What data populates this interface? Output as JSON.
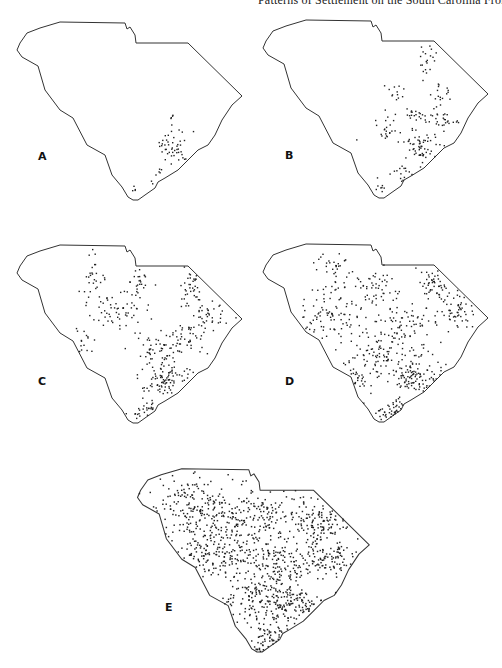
{
  "page": {
    "running_head": "Patterns of Settlement on the South Carolina Frontier"
  },
  "figure": {
    "outline_path": "M17,50 L20,43 L27,33 L40,28 L50,25 L60,22 L125,23 L127,29 L130,27 L135,35 L136,43 L188,43 L242,96 L232,105 L222,120 L215,135 L208,145 L198,150 L188,160 L178,170 L165,178 L158,182 L155,188 L145,195 L138,200 L133,200 L128,197 L122,187 L112,175 L105,155 L87,145 L73,118 L60,110 L45,90 L38,66 L22,57 Z",
    "panels": [
      {
        "label": "A",
        "offset": [
          0,
          0
        ],
        "scale": 1,
        "label_pos": [
          38,
          160
        ],
        "clusters": [
          {
            "cx": 172,
            "cy": 116,
            "rx": 4,
            "ry": 3,
            "n": 4
          },
          {
            "cx": 174,
            "cy": 147,
            "rx": 12,
            "ry": 14,
            "n": 45
          },
          {
            "cx": 194,
            "cy": 132,
            "rx": 1,
            "ry": 1,
            "n": 1
          },
          {
            "cx": 161,
            "cy": 172,
            "rx": 4,
            "ry": 4,
            "n": 5
          },
          {
            "cx": 150,
            "cy": 182,
            "rx": 3,
            "ry": 2,
            "n": 2
          },
          {
            "cx": 134,
            "cy": 189,
            "rx": 3,
            "ry": 3,
            "n": 4
          }
        ]
      },
      {
        "label": "B",
        "offset": [
          246,
          -2
        ],
        "scale": 1,
        "label_pos": [
          285,
          159
        ],
        "clusters": [
          {
            "cx": 180,
            "cy": 60,
            "rx": 8,
            "ry": 15,
            "n": 20
          },
          {
            "cx": 195,
            "cy": 95,
            "rx": 10,
            "ry": 12,
            "n": 18
          },
          {
            "cx": 150,
            "cy": 95,
            "rx": 10,
            "ry": 8,
            "n": 12
          },
          {
            "cx": 160,
            "cy": 118,
            "rx": 22,
            "ry": 7,
            "n": 25
          },
          {
            "cx": 200,
            "cy": 122,
            "rx": 16,
            "ry": 8,
            "n": 25
          },
          {
            "cx": 140,
            "cy": 135,
            "rx": 14,
            "ry": 10,
            "n": 20
          },
          {
            "cx": 175,
            "cy": 150,
            "rx": 14,
            "ry": 14,
            "n": 60
          },
          {
            "cx": 158,
            "cy": 175,
            "rx": 8,
            "ry": 8,
            "n": 15
          },
          {
            "cx": 134,
            "cy": 188,
            "rx": 4,
            "ry": 4,
            "n": 8
          }
        ]
      },
      {
        "label": "C",
        "offset": [
          0,
          223
        ],
        "scale": 1,
        "label_pos": [
          38,
          385
        ],
        "clusters": [
          {
            "cx": 95,
            "cy": 55,
            "rx": 10,
            "ry": 18,
            "n": 25
          },
          {
            "cx": 115,
            "cy": 85,
            "rx": 30,
            "ry": 15,
            "n": 60
          },
          {
            "cx": 140,
            "cy": 60,
            "rx": 8,
            "ry": 20,
            "n": 25
          },
          {
            "cx": 190,
            "cy": 60,
            "rx": 10,
            "ry": 18,
            "n": 35
          },
          {
            "cx": 210,
            "cy": 90,
            "rx": 18,
            "ry": 12,
            "n": 40
          },
          {
            "cx": 190,
            "cy": 115,
            "rx": 15,
            "ry": 12,
            "n": 35
          },
          {
            "cx": 160,
            "cy": 125,
            "rx": 25,
            "ry": 12,
            "n": 60
          },
          {
            "cx": 165,
            "cy": 155,
            "rx": 22,
            "ry": 15,
            "n": 90
          },
          {
            "cx": 85,
            "cy": 120,
            "rx": 10,
            "ry": 15,
            "n": 15
          },
          {
            "cx": 150,
            "cy": 185,
            "rx": 10,
            "ry": 10,
            "n": 20
          },
          {
            "cx": 135,
            "cy": 190,
            "rx": 5,
            "ry": 5,
            "n": 8
          }
        ]
      },
      {
        "label": "D",
        "offset": [
          246,
          222
        ],
        "scale": 1,
        "label_pos": [
          285,
          385
        ],
        "clusters": [
          {
            "cx": 90,
            "cy": 55,
            "rx": 15,
            "ry": 20,
            "n": 45
          },
          {
            "cx": 125,
            "cy": 65,
            "rx": 20,
            "ry": 20,
            "n": 50
          },
          {
            "cx": 80,
            "cy": 95,
            "rx": 30,
            "ry": 20,
            "n": 80
          },
          {
            "cx": 190,
            "cy": 60,
            "rx": 15,
            "ry": 18,
            "n": 50
          },
          {
            "cx": 210,
            "cy": 90,
            "rx": 18,
            "ry": 15,
            "n": 55
          },
          {
            "cx": 160,
            "cy": 100,
            "rx": 30,
            "ry": 15,
            "n": 70
          },
          {
            "cx": 140,
            "cy": 130,
            "rx": 35,
            "ry": 15,
            "n": 90
          },
          {
            "cx": 170,
            "cy": 155,
            "rx": 25,
            "ry": 15,
            "n": 110
          },
          {
            "cx": 110,
            "cy": 155,
            "rx": 15,
            "ry": 15,
            "n": 30
          },
          {
            "cx": 150,
            "cy": 185,
            "rx": 10,
            "ry": 10,
            "n": 25
          },
          {
            "cx": 138,
            "cy": 192,
            "rx": 6,
            "ry": 6,
            "n": 15
          }
        ]
      },
      {
        "label": "E",
        "offset": [
          120,
          446
        ],
        "scale": 1.03,
        "label_pos": [
          165,
          611
        ],
        "clusters": [
          {
            "cx": 70,
            "cy": 60,
            "rx": 35,
            "ry": 25,
            "n": 180
          },
          {
            "cx": 130,
            "cy": 70,
            "rx": 35,
            "ry": 25,
            "n": 170
          },
          {
            "cx": 195,
            "cy": 75,
            "rx": 25,
            "ry": 25,
            "n": 130
          },
          {
            "cx": 90,
            "cy": 105,
            "rx": 35,
            "ry": 20,
            "n": 150
          },
          {
            "cx": 150,
            "cy": 115,
            "rx": 40,
            "ry": 20,
            "n": 180
          },
          {
            "cx": 205,
            "cy": 110,
            "rx": 20,
            "ry": 15,
            "n": 70
          },
          {
            "cx": 130,
            "cy": 150,
            "rx": 25,
            "ry": 20,
            "n": 110
          },
          {
            "cx": 170,
            "cy": 155,
            "rx": 25,
            "ry": 15,
            "n": 120
          },
          {
            "cx": 145,
            "cy": 185,
            "rx": 12,
            "ry": 10,
            "n": 40
          },
          {
            "cx": 135,
            "cy": 195,
            "rx": 6,
            "ry": 5,
            "n": 15
          }
        ]
      }
    ]
  }
}
